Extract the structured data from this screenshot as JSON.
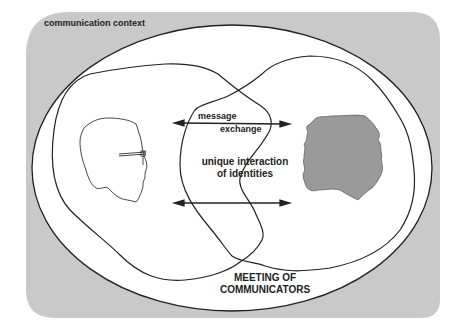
{
  "diagram": {
    "title": "communication context",
    "labels": {
      "context": "communication context",
      "message_line1": "message",
      "message_line2": "exchange",
      "unique_line1": "unique interaction",
      "unique_line2": "of identities",
      "meeting_line1": "MEETING OF",
      "meeting_line2": "COMMUNICATORS"
    },
    "elements": [
      {
        "id": "context-background",
        "shape": "rounded-rectangle",
        "fill": "#c9c9c9"
      },
      {
        "id": "context-ellipse",
        "shape": "ellipse",
        "fill": "#ffffff",
        "stroke": "#222222"
      },
      {
        "id": "communicator-left-region",
        "shape": "blob",
        "stroke": "#222222"
      },
      {
        "id": "communicator-right-region",
        "shape": "blob",
        "stroke": "#222222"
      },
      {
        "id": "left-head-profile",
        "shape": "outline-head-with-glasses",
        "stroke": "#333333"
      },
      {
        "id": "right-head-silhouette",
        "shape": "filled-head",
        "fill": "#9a9a9a"
      },
      {
        "id": "top-double-arrow",
        "shape": "double-arrow"
      },
      {
        "id": "bottom-double-arrow",
        "shape": "double-arrow"
      }
    ],
    "colors": {
      "background_gray": "#c9c9c9",
      "line": "#222222",
      "silhouette_gray": "#9a9a9a"
    }
  }
}
